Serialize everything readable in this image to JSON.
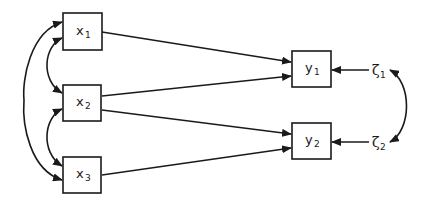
{
  "diagram": {
    "type": "path diagram",
    "exogenous": [
      {
        "id": "x1",
        "base": "x",
        "sub": "1"
      },
      {
        "id": "x2",
        "base": "x",
        "sub": "2"
      },
      {
        "id": "x3",
        "base": "x",
        "sub": "3"
      }
    ],
    "endogenous": [
      {
        "id": "y1",
        "base": "y",
        "sub": "1"
      },
      {
        "id": "y2",
        "base": "y",
        "sub": "2"
      }
    ],
    "disturbances": [
      {
        "id": "zeta1",
        "base": "ζ",
        "sub": "1",
        "target": "y1"
      },
      {
        "id": "zeta2",
        "base": "ζ",
        "sub": "2",
        "target": "y2"
      }
    ],
    "directed_paths": [
      {
        "from": "x1",
        "to": "y1"
      },
      {
        "from": "x2",
        "to": "y1"
      },
      {
        "from": "x2",
        "to": "y2"
      },
      {
        "from": "x3",
        "to": "y2"
      },
      {
        "from": "zeta1",
        "to": "y1"
      },
      {
        "from": "zeta2",
        "to": "y2"
      }
    ],
    "covariances": [
      {
        "between": [
          "x1",
          "x2"
        ]
      },
      {
        "between": [
          "x2",
          "x3"
        ]
      },
      {
        "between": [
          "x1",
          "x3"
        ]
      },
      {
        "between": [
          "zeta1",
          "zeta2"
        ]
      }
    ],
    "colors": {
      "stroke": "#1a1a1a",
      "background": "#ffffff"
    }
  }
}
